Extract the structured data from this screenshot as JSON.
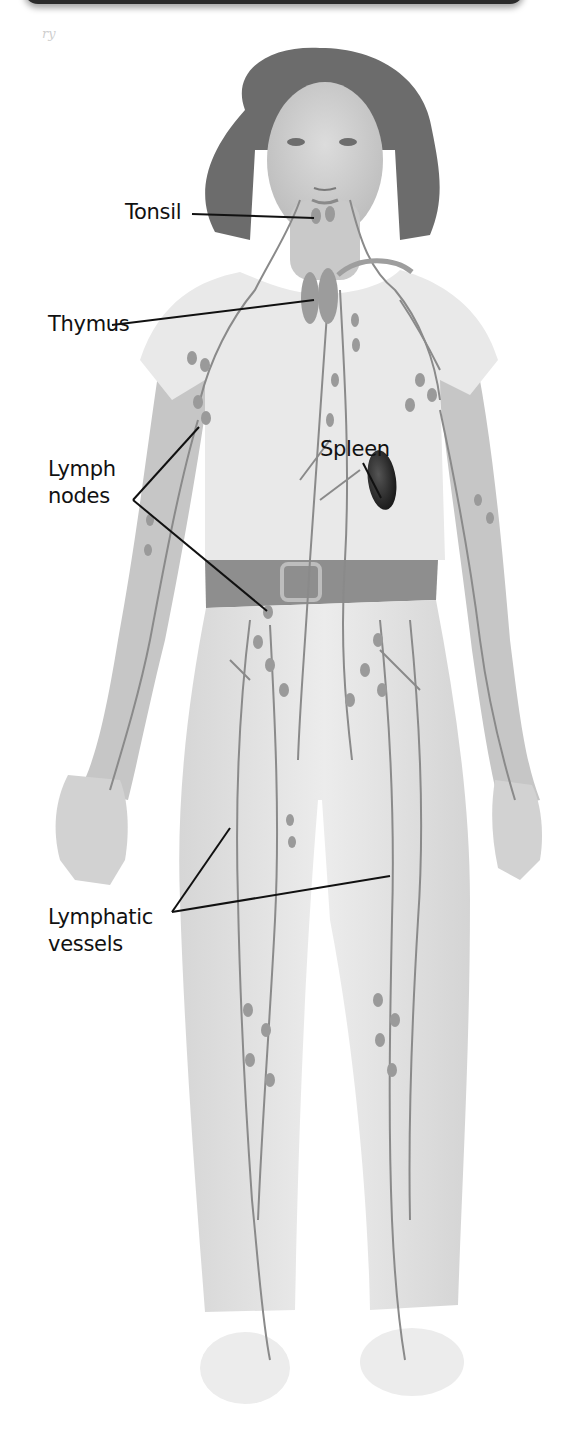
{
  "figure": {
    "style": "grayscale illustration",
    "colors": {
      "background": "#ffffff",
      "header_bar": "#2b2b2b",
      "leader_line": "#111111",
      "label_text": "#111111",
      "vessel": "#8a8a8a",
      "node": "#9a9a9a",
      "spleen": "#2a2a2a",
      "clothing": "#e6e6e6",
      "skin": "#cfcfcf",
      "hair": "#6a6a6a",
      "belt": "#8c8c8c"
    }
  },
  "corner_mark": "ry",
  "labels": {
    "tonsil": {
      "lines": [
        "Tonsil"
      ],
      "x": 125,
      "y": 199
    },
    "thymus": {
      "lines": [
        "Thymus"
      ],
      "x": 48,
      "y": 311
    },
    "spleen": {
      "lines": [
        "Spleen"
      ],
      "x": 320,
      "y": 436
    },
    "lymph_nodes": {
      "lines": [
        "Lymph",
        "nodes"
      ],
      "x": 48,
      "y": 456
    },
    "lymphatic_vessels": {
      "lines": [
        "Lymphatic",
        "vessels"
      ],
      "x": 48,
      "y": 904
    }
  },
  "leader_lines": [
    {
      "name": "tonsil-leader",
      "points": [
        [
          192,
          214
        ],
        [
          314,
          218
        ]
      ]
    },
    {
      "name": "thymus-leader",
      "points": [
        [
          112,
          325
        ],
        [
          314,
          300
        ]
      ]
    },
    {
      "name": "spleen-leader",
      "points": [
        [
          363,
          463
        ],
        [
          381,
          498
        ]
      ]
    },
    {
      "name": "lymph-nodes-leader-axillary",
      "points": [
        [
          133,
          500
        ],
        [
          199,
          427
        ]
      ]
    },
    {
      "name": "lymph-nodes-leader-inguinal",
      "points": [
        [
          133,
          500
        ],
        [
          267,
          611
        ]
      ]
    },
    {
      "name": "lymphatic-vessels-leader-left",
      "points": [
        [
          172,
          912
        ],
        [
          230,
          828
        ]
      ]
    },
    {
      "name": "lymphatic-vessels-leader-right",
      "points": [
        [
          172,
          912
        ],
        [
          390,
          876
        ]
      ]
    }
  ]
}
